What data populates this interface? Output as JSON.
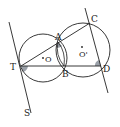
{
  "figure": {
    "type": "geometry",
    "colors": {
      "stroke": "#222222",
      "angle_fill": "#9aa0a8",
      "background": "#ffffff"
    },
    "points": {
      "A": {
        "label": "A",
        "x": 58,
        "y": 42
      },
      "B": {
        "label": "B",
        "x": 64,
        "y": 66
      },
      "C": {
        "label": "C",
        "x": 90,
        "y": 23
      },
      "D": {
        "label": "D",
        "x": 101,
        "y": 66
      },
      "T": {
        "label": "T",
        "x": 21,
        "y": 66
      },
      "S": {
        "label": "S"
      },
      "O": {
        "label": "O",
        "x": 43,
        "y": 58
      },
      "O_prime": {
        "label": "O'",
        "x": 83,
        "y": 50
      }
    },
    "circles": [
      {
        "name": "circle-O",
        "center": "O",
        "r": 24
      },
      {
        "name": "circle-O-prime",
        "center": "O'",
        "r": 27
      }
    ],
    "segments": [
      "T-C",
      "T-D",
      "A-B",
      "C-D extended",
      "tangent T-S"
    ],
    "marked_angles": [
      "angle at T",
      "angle at A",
      "angle at D"
    ]
  }
}
